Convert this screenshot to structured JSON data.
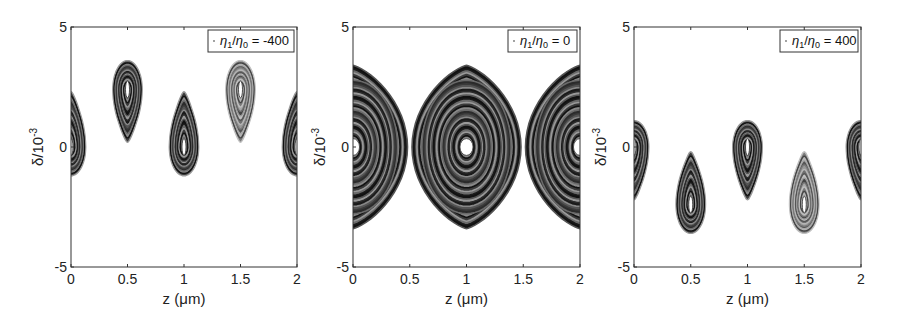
{
  "figure": {
    "panel_count": 3,
    "background": "#ffffff",
    "ink": "#222222"
  },
  "chart_data": [
    {
      "type": "scatter",
      "title": "",
      "subtitle": "Longitudinal phase space (Poincaré contours)",
      "legend": [
        "η₁/η₀ = -400"
      ],
      "legend_parts": {
        "eta1": "η",
        "sub1": "1",
        "slash": "/",
        "eta0": "η",
        "sub0": "0",
        "rest": " = -400"
      },
      "legend_position": "upper right",
      "xlabel": "z (μm)",
      "ylabel": "δ/10⁻³",
      "ylabel_parts": {
        "base": "δ/10",
        "exp": "-3"
      },
      "xlim": [
        0,
        2
      ],
      "ylim": [
        -5,
        5
      ],
      "xticks": [
        0,
        0.5,
        1,
        1.5,
        2
      ],
      "xtick_labels": [
        "0",
        "0.5",
        "1",
        "1.5",
        "2"
      ],
      "yticks": [
        -5,
        0,
        5
      ],
      "ytick_labels": [
        "-5",
        "0",
        "5"
      ],
      "grid": false,
      "islands": [
        {
          "z_center": 0.0,
          "delta_center": 0.0,
          "delta_top": 2.3,
          "delta_bottom": -1.2,
          "half_width": 0.13,
          "shape": "teardrop-up-tail",
          "shade": "dark"
        },
        {
          "z_center": 0.5,
          "delta_center": 2.4,
          "delta_top": 3.6,
          "delta_bottom": 0.2,
          "half_width": 0.13,
          "shape": "teardrop-down-tail",
          "shade": "dark"
        },
        {
          "z_center": 1.0,
          "delta_center": 0.0,
          "delta_top": 2.3,
          "delta_bottom": -1.2,
          "half_width": 0.13,
          "shape": "teardrop-up-tail",
          "shade": "dark"
        },
        {
          "z_center": 1.5,
          "delta_center": 2.4,
          "delta_top": 3.6,
          "delta_bottom": 0.2,
          "half_width": 0.13,
          "shape": "teardrop-down-tail",
          "shade": "light"
        },
        {
          "z_center": 2.0,
          "delta_center": 0.0,
          "delta_top": 2.3,
          "delta_bottom": -1.2,
          "half_width": 0.13,
          "shape": "teardrop-up-tail",
          "shade": "dark"
        }
      ]
    },
    {
      "type": "scatter",
      "title": "",
      "subtitle": "Longitudinal phase space (Poincaré contours)",
      "legend": [
        "η₁/η₀ = 0"
      ],
      "legend_parts": {
        "eta1": "η",
        "sub1": "1",
        "slash": "/",
        "eta0": "η",
        "sub0": "0",
        "rest": " = 0"
      },
      "legend_position": "upper right",
      "xlabel": "z (μm)",
      "ylabel": "δ/10⁻³",
      "ylabel_parts": {
        "base": "δ/10",
        "exp": "-3"
      },
      "xlim": [
        0,
        2
      ],
      "ylim": [
        -5,
        5
      ],
      "xticks": [
        0,
        0.5,
        1,
        1.5,
        2
      ],
      "xtick_labels": [
        "0",
        "0.5",
        "1",
        "1.5",
        "2"
      ],
      "yticks": [
        -5,
        0,
        5
      ],
      "ytick_labels": [
        "-5",
        "0",
        "5"
      ],
      "grid": false,
      "islands": [
        {
          "z_center": 0.0,
          "delta_center": 0.0,
          "delta_top": 3.4,
          "delta_bottom": -3.4,
          "half_width": 0.48,
          "shape": "bucket",
          "shade": "dark"
        },
        {
          "z_center": 1.0,
          "delta_center": 0.0,
          "delta_top": 3.4,
          "delta_bottom": -3.4,
          "half_width": 0.48,
          "shape": "bucket",
          "shade": "dark"
        },
        {
          "z_center": 2.0,
          "delta_center": 0.0,
          "delta_top": 3.4,
          "delta_bottom": -3.4,
          "half_width": 0.48,
          "shape": "bucket",
          "shade": "dark"
        }
      ]
    },
    {
      "type": "scatter",
      "title": "",
      "subtitle": "Longitudinal phase space (Poincaré contours)",
      "legend": [
        "η₁/η₀ = 400"
      ],
      "legend_parts": {
        "eta1": "η",
        "sub1": "1",
        "slash": "/",
        "eta0": "η",
        "sub0": "0",
        "rest": " = 400"
      },
      "legend_position": "upper right",
      "xlabel": "z (μm)",
      "ylabel": "δ/10⁻³",
      "ylabel_parts": {
        "base": "δ/10",
        "exp": "-3"
      },
      "xlim": [
        0,
        2
      ],
      "ylim": [
        -5,
        5
      ],
      "xticks": [
        0,
        0.5,
        1,
        1.5,
        2
      ],
      "xtick_labels": [
        "0",
        "0.5",
        "1",
        "1.5",
        "2"
      ],
      "yticks": [
        -5,
        0,
        5
      ],
      "ytick_labels": [
        "-5",
        "0",
        "5"
      ],
      "grid": false,
      "islands": [
        {
          "z_center": 0.0,
          "delta_center": 0.0,
          "delta_top": 1.1,
          "delta_bottom": -2.2,
          "half_width": 0.13,
          "shape": "teardrop-down-tail",
          "shade": "dark"
        },
        {
          "z_center": 0.5,
          "delta_center": -2.4,
          "delta_top": -0.2,
          "delta_bottom": -3.6,
          "half_width": 0.13,
          "shape": "teardrop-up-tail",
          "shade": "dark"
        },
        {
          "z_center": 1.0,
          "delta_center": 0.0,
          "delta_top": 1.1,
          "delta_bottom": -2.2,
          "half_width": 0.13,
          "shape": "teardrop-down-tail",
          "shade": "dark"
        },
        {
          "z_center": 1.5,
          "delta_center": -2.4,
          "delta_top": -0.2,
          "delta_bottom": -3.6,
          "half_width": 0.13,
          "shape": "teardrop-up-tail",
          "shade": "light"
        },
        {
          "z_center": 2.0,
          "delta_center": 0.0,
          "delta_top": 1.1,
          "delta_bottom": -2.2,
          "half_width": 0.13,
          "shape": "teardrop-down-tail",
          "shade": "dark"
        }
      ]
    }
  ],
  "layout": {
    "panels": [
      {
        "x0": 71,
        "x1": 297,
        "y0": 27,
        "y1": 267
      },
      {
        "x0": 353,
        "x1": 580,
        "y0": 27,
        "y1": 267
      },
      {
        "x0": 634,
        "x1": 861,
        "y0": 27,
        "y1": 267
      }
    ]
  }
}
